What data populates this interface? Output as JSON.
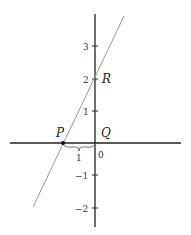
{
  "diagram": {
    "type": "coordinate-plane-line",
    "points": {
      "P": {
        "label": "P",
        "x": -1,
        "y": 0
      },
      "Q": {
        "label": "Q",
        "x": 0,
        "y": 0
      },
      "R": {
        "label": "R",
        "x": 0,
        "y": 2
      }
    },
    "y_ticks": [
      {
        "value": 3,
        "label": "3"
      },
      {
        "value": 2,
        "label": "2"
      },
      {
        "value": 1,
        "label": "1"
      },
      {
        "value": -1,
        "label": "−1"
      },
      {
        "value": -2,
        "label": "−2"
      }
    ],
    "origin_label": "0",
    "brace_label": "1",
    "line": {
      "slope": 2,
      "intercept": 2
    }
  }
}
